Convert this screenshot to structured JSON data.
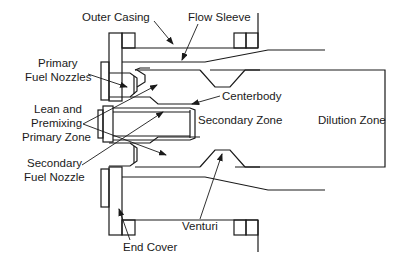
{
  "diagram": {
    "labels": {
      "outer_casing": "Outer Casing",
      "flow_sleeve": "Flow Sleeve",
      "primary_fuel_nozzles_1": "Primary",
      "primary_fuel_nozzles_2": "Fuel Nozzles",
      "lean_premix_1": "Lean and",
      "lean_premix_2": "Premixing",
      "lean_premix_3": "Primary Zone",
      "centerbody": "Centerbody",
      "secondary_zone": "Secondary Zone",
      "dilution_zone": "Dilution Zone",
      "secondary_fuel_nozzle_1": "Secondary",
      "secondary_fuel_nozzle_2": "Fuel Nozzle",
      "venturi": "Venturi",
      "end_cover": "End Cover"
    }
  }
}
